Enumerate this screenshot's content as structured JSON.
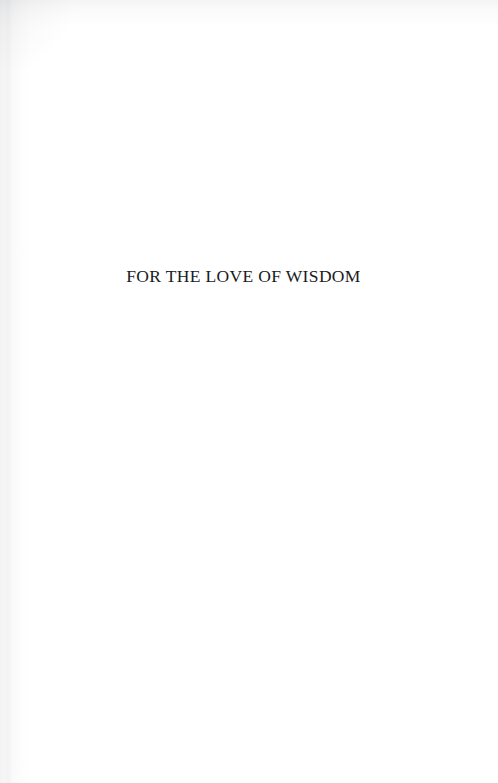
{
  "page": {
    "kind": "scanned-book-page",
    "page_type": "half-title-page",
    "background_color": "#ffffff",
    "text_color": "#1b1b1d"
  },
  "content": {
    "title": "FOR THE LOVE OF WISDOM"
  }
}
